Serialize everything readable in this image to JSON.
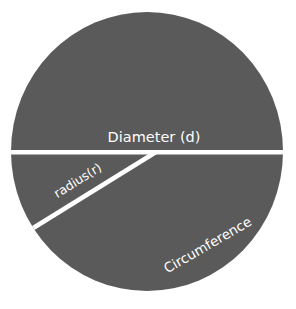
{
  "diagram": {
    "labels": {
      "diameter": "Diameter (d)",
      "radius": "radius(r)",
      "circumference": "Circumference"
    },
    "colors": {
      "circle_fill": "#5a5a5a",
      "line": "#ffffff",
      "text": "#ffffff",
      "background": "#ffffff"
    }
  }
}
